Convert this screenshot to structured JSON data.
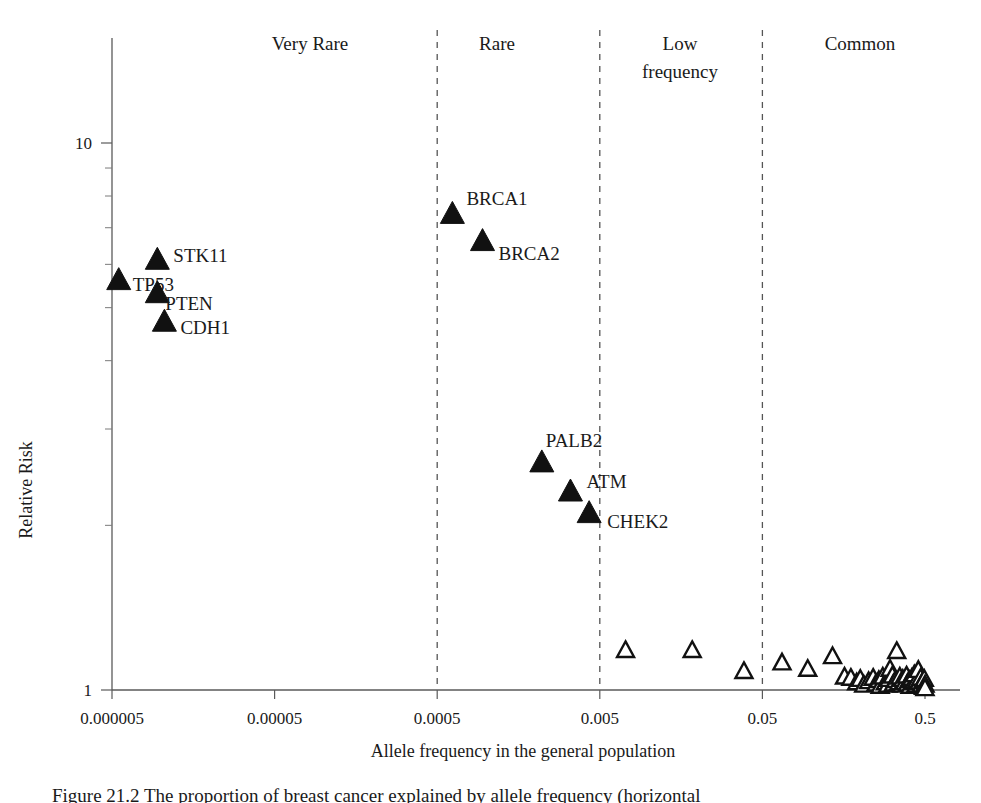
{
  "chart_data": {
    "type": "scatter",
    "title": "",
    "xlabel": "Allele frequency in the general population",
    "ylabel": "Relative Risk",
    "xscale": "log",
    "yscale": "log",
    "xlim": [
      5e-06,
      0.5
    ],
    "ylim": [
      1,
      20
    ],
    "x_tick_labels": [
      "0.000005",
      "0.00005",
      "0.0005",
      "0.005",
      "0.05",
      "0.5"
    ],
    "x_tick_values": [
      5e-06,
      5e-05,
      0.0005,
      0.005,
      0.05,
      0.5
    ],
    "y_tick_labels": [
      "10",
      "1"
    ],
    "y_tick_values": [
      10,
      1
    ],
    "grid": false,
    "legend": "none",
    "category_bands": [
      {
        "label": "Very Rare",
        "x_from": 5e-06,
        "x_to": 0.0005
      },
      {
        "label": "Rare",
        "x_from": 0.0005,
        "x_to": 0.005
      },
      {
        "label": "Low frequency",
        "x_from": 0.005,
        "x_to": 0.05
      },
      {
        "label": "Common",
        "x_from": 0.05,
        "x_to": 0.5
      }
    ],
    "divider_values": [
      0.0005,
      0.005,
      0.05
    ],
    "series": [
      {
        "name": "High-penetrance / moderate-penetrance genes",
        "marker": "filled-triangle",
        "points": [
          {
            "label": "TP53",
            "x": 5.5e-06,
            "y": 5.6,
            "label_dx": 14,
            "label_dy": 10
          },
          {
            "label": "STK11",
            "x": 9.5e-06,
            "y": 6.1,
            "label_dx": 16,
            "label_dy": 2
          },
          {
            "label": "PTEN",
            "x": 9.5e-06,
            "y": 5.3,
            "label_dx": 8,
            "label_dy": 16
          },
          {
            "label": "CDH1",
            "x": 1.05e-05,
            "y": 4.7,
            "label_dx": 16,
            "label_dy": 12
          },
          {
            "label": "BRCA1",
            "x": 0.00062,
            "y": 7.4,
            "label_dx": 14,
            "label_dy": -10
          },
          {
            "label": "BRCA2",
            "x": 0.00095,
            "y": 6.6,
            "label_dx": 16,
            "label_dy": 18
          },
          {
            "label": "PALB2",
            "x": 0.0022,
            "y": 2.6,
            "label_dx": 4,
            "label_dy": -16
          },
          {
            "label": "ATM",
            "x": 0.0033,
            "y": 2.3,
            "label_dx": 16,
            "label_dy": -4
          },
          {
            "label": "CHEK2",
            "x": 0.0043,
            "y": 2.1,
            "label_dx": 18,
            "label_dy": 14
          }
        ]
      },
      {
        "name": "Common low-risk variants (GWAS loci)",
        "marker": "open-triangle",
        "points": [
          {
            "x": 0.0072,
            "y": 1.18
          },
          {
            "x": 0.0185,
            "y": 1.18
          },
          {
            "x": 0.0385,
            "y": 1.08
          },
          {
            "x": 0.066,
            "y": 1.12
          },
          {
            "x": 0.095,
            "y": 1.09
          },
          {
            "x": 0.135,
            "y": 1.15
          },
          {
            "x": 0.16,
            "y": 1.055
          },
          {
            "x": 0.175,
            "y": 1.05
          },
          {
            "x": 0.19,
            "y": 1.03
          },
          {
            "x": 0.2,
            "y": 1.045
          },
          {
            "x": 0.21,
            "y": 1.02
          },
          {
            "x": 0.225,
            "y": 1.035
          },
          {
            "x": 0.24,
            "y": 1.05
          },
          {
            "x": 0.25,
            "y": 1.025
          },
          {
            "x": 0.26,
            "y": 1.04
          },
          {
            "x": 0.265,
            "y": 1.015
          },
          {
            "x": 0.275,
            "y": 1.055
          },
          {
            "x": 0.285,
            "y": 1.03
          },
          {
            "x": 0.295,
            "y": 1.02
          },
          {
            "x": 0.3,
            "y": 1.045
          },
          {
            "x": 0.305,
            "y": 1.09
          },
          {
            "x": 0.315,
            "y": 1.06
          },
          {
            "x": 0.32,
            "y": 1.025
          },
          {
            "x": 0.33,
            "y": 1.04
          },
          {
            "x": 0.335,
            "y": 1.175
          },
          {
            "x": 0.345,
            "y": 1.03
          },
          {
            "x": 0.35,
            "y": 1.055
          },
          {
            "x": 0.36,
            "y": 1.02
          },
          {
            "x": 0.365,
            "y": 1.045
          },
          {
            "x": 0.375,
            "y": 1.03
          },
          {
            "x": 0.385,
            "y": 1.06
          },
          {
            "x": 0.39,
            "y": 1.025
          },
          {
            "x": 0.4,
            "y": 1.04
          },
          {
            "x": 0.405,
            "y": 1.015
          },
          {
            "x": 0.415,
            "y": 1.05
          },
          {
            "x": 0.425,
            "y": 1.03
          },
          {
            "x": 0.43,
            "y": 1.065
          },
          {
            "x": 0.44,
            "y": 1.02
          },
          {
            "x": 0.445,
            "y": 1.04
          },
          {
            "x": 0.455,
            "y": 1.085
          },
          {
            "x": 0.46,
            "y": 1.03
          },
          {
            "x": 0.47,
            "y": 1.05
          },
          {
            "x": 0.475,
            "y": 1.02
          },
          {
            "x": 0.485,
            "y": 1.035
          },
          {
            "x": 0.49,
            "y": 1.01
          },
          {
            "x": 0.495,
            "y": 1.045
          },
          {
            "x": 0.5,
            "y": 1.02
          },
          {
            "x": 0.5,
            "y": 1.005
          }
        ]
      }
    ]
  },
  "caption": {
    "text": "Figure 21.2 The proportion of breast cancer explained by allele frequency (horizontal"
  }
}
